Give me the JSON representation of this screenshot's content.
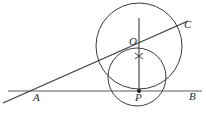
{
  "figure": {
    "name": "tangent-circles-geometry-figure",
    "type": "geometry-diagram",
    "width": 206,
    "height": 116,
    "background_color": "#ffffff",
    "stroke_color": "#3a3a3a",
    "label_color": "#2b2b2b"
  },
  "labels": {
    "A": "A",
    "B": "B",
    "C": "C",
    "O": "O",
    "P": "P"
  },
  "label_positions": {
    "A": {
      "x": 33,
      "y": 98
    },
    "B": {
      "x": 189,
      "y": 97
    },
    "C": {
      "x": 184,
      "y": 25
    },
    "O": {
      "x": 129,
      "y": 42
    },
    "P": {
      "x": 135,
      "y": 98
    }
  },
  "geometry": {
    "baseline": {
      "x1": 8,
      "y1": 91,
      "x2": 202,
      "y2": 91,
      "name": "line-AB"
    },
    "secant": {
      "x1": 3,
      "y1": 103,
      "x2": 188,
      "y2": 21,
      "name": "line-AC"
    },
    "vertical": {
      "x1": 139,
      "y1": 18,
      "x2": 139,
      "y2": 92,
      "name": "line-OP-vertical"
    },
    "large_circle": {
      "cx": 139,
      "cy": 46,
      "r": 43,
      "name": "large-circle"
    },
    "small_circle": {
      "cx": 137,
      "cy": 77,
      "r": 29,
      "name": "small-circle"
    },
    "point_P": {
      "x": 139,
      "y": 91,
      "r": 2.1,
      "name": "point-P-marker"
    },
    "tick_mark": {
      "x": 139,
      "y": 56,
      "size": 4,
      "name": "congruence-tick-mark"
    }
  }
}
